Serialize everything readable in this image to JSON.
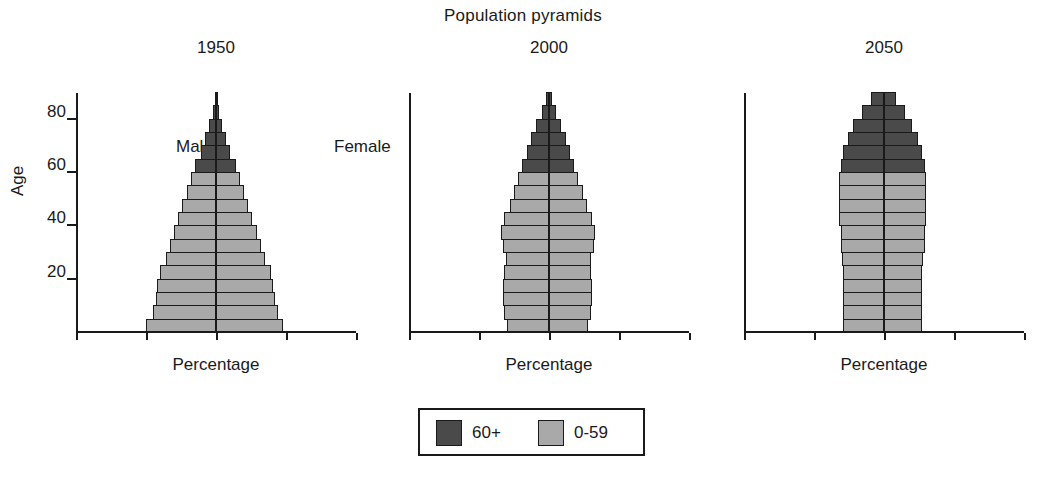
{
  "chart_title": "Population pyramids",
  "legend": {
    "items": [
      {
        "label": "60+",
        "color": "#4a4a4a",
        "key": "old"
      },
      {
        "label": "0-59",
        "color": "#a9a9a9",
        "key": "young"
      }
    ]
  },
  "annotations": {
    "male": "Male",
    "female": "Female"
  },
  "axes": {
    "ylabel": "Age",
    "xlabel": "Percentage",
    "xticks": [
      "10",
      "5",
      "0",
      "5",
      "10"
    ],
    "xtick_values": [
      -10,
      -5,
      0,
      5,
      10
    ],
    "yticks": [
      "20",
      "40",
      "60",
      "80"
    ],
    "ytick_values": [
      20,
      40,
      60,
      80
    ],
    "xlim": [
      -10,
      10
    ],
    "ylim": [
      0,
      90
    ]
  },
  "chart_data": {
    "type": "bar",
    "subtype": "population-pyramid",
    "title": "Population pyramids",
    "xlabel": "Percentage",
    "ylabel": "Age",
    "xlim": [
      -10,
      10
    ],
    "ylim": [
      0,
      90
    ],
    "grid": false,
    "legend_position": "bottom-center",
    "legend": [
      "60+",
      "0-59"
    ],
    "colors": {
      "60+": "#4a4a4a",
      "0-59": "#a9a9a9"
    },
    "age_groups": [
      "0-4",
      "5-9",
      "10-14",
      "15-19",
      "20-24",
      "25-29",
      "30-34",
      "35-39",
      "40-44",
      "45-49",
      "50-54",
      "55-59",
      "60-64",
      "65-69",
      "70-74",
      "75-79",
      "80-84",
      "85+"
    ],
    "panels": [
      {
        "title": "1950",
        "series": [
          {
            "name": "Male",
            "side": "left",
            "values": [
              5.0,
              4.5,
              4.3,
              4.2,
              4.0,
              3.6,
              3.3,
              3.0,
              2.7,
              2.4,
              2.1,
              1.8,
              1.5,
              1.1,
              0.8,
              0.5,
              0.25,
              0.1
            ]
          },
          {
            "name": "Female",
            "side": "right",
            "values": [
              4.8,
              4.4,
              4.2,
              4.1,
              3.9,
              3.5,
              3.2,
              2.9,
              2.6,
              2.3,
              2.0,
              1.7,
              1.4,
              1.0,
              0.7,
              0.45,
              0.22,
              0.1
            ]
          }
        ]
      },
      {
        "title": "2000",
        "series": [
          {
            "name": "Male",
            "side": "left",
            "values": [
              3.0,
              3.2,
              3.3,
              3.3,
              3.2,
              3.1,
              3.3,
              3.4,
              3.2,
              2.8,
              2.5,
              2.2,
              1.9,
              1.6,
              1.3,
              0.9,
              0.5,
              0.2
            ]
          },
          {
            "name": "Female",
            "side": "right",
            "values": [
              2.8,
              3.0,
              3.1,
              3.1,
              3.0,
              3.0,
              3.2,
              3.3,
              3.1,
              2.7,
              2.4,
              2.1,
              1.8,
              1.5,
              1.2,
              0.85,
              0.5,
              0.2
            ]
          }
        ]
      },
      {
        "title": "2050",
        "series": [
          {
            "name": "Male",
            "side": "left",
            "values": [
              2.9,
              2.9,
              2.9,
              2.9,
              2.9,
              3.0,
              3.1,
              3.1,
              3.2,
              3.2,
              3.2,
              3.2,
              3.1,
              2.9,
              2.6,
              2.2,
              1.6,
              0.9
            ]
          },
          {
            "name": "Female",
            "side": "right",
            "values": [
              2.7,
              2.7,
              2.7,
              2.7,
              2.7,
              2.8,
              2.9,
              2.9,
              3.0,
              3.0,
              3.0,
              3.0,
              2.9,
              2.7,
              2.4,
              2.0,
              1.5,
              0.85
            ]
          }
        ]
      }
    ]
  }
}
